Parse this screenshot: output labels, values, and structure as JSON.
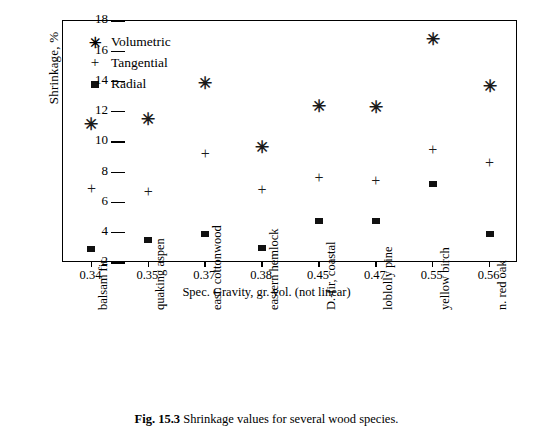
{
  "figure": {
    "caption_number": "Fig. 15.3",
    "caption_text": "Shrinkage values for several wood species."
  },
  "chart_data": {
    "type": "scatter",
    "title": "",
    "xlabel": "Spec. Gravity, gr. vol. (not linear)",
    "ylabel": "Shrinkage, %",
    "ylim": [
      2,
      18
    ],
    "yticks": [
      2,
      4,
      6,
      8,
      10,
      12,
      14,
      16,
      18
    ],
    "ytick_labels": [
      "2",
      "4",
      "6",
      "8",
      "10",
      "12",
      "14",
      "16",
      "18"
    ],
    "grid": false,
    "legend_position": "top-left",
    "x_axis_note": "not linear",
    "categories": [
      "0.34",
      "0.35",
      "0.37",
      "0.38",
      "0.45",
      "0.47",
      "0.55",
      "0.56"
    ],
    "category_names": [
      "balsam fir",
      "quaking aspen",
      "east. cottonwood",
      "eastern hemlock",
      "D.-fir, coastal",
      "loblolly pine",
      "yellow birch",
      "n. red oak"
    ],
    "series": [
      {
        "name": "Volumetric",
        "marker": "asterisk",
        "symbol": "✳",
        "values": [
          11.2,
          11.5,
          13.9,
          9.7,
          12.4,
          12.3,
          16.8,
          13.7
        ]
      },
      {
        "name": "Tangential",
        "marker": "plus",
        "symbol": "+",
        "values": [
          6.9,
          6.7,
          9.2,
          6.8,
          7.6,
          7.4,
          9.5,
          8.6
        ]
      },
      {
        "name": "Radial",
        "marker": "square",
        "symbol": "■",
        "values": [
          2.9,
          3.5,
          3.9,
          3.0,
          4.8,
          4.8,
          7.2,
          3.9
        ]
      }
    ]
  },
  "legend": {
    "items": [
      {
        "label": "Volumetric",
        "symbol": "✳"
      },
      {
        "label": "Tangential",
        "symbol": "+"
      },
      {
        "label": "Radial",
        "symbol": "■"
      }
    ]
  },
  "colors": {
    "axis": "#000000",
    "marker": "#111111",
    "background": "#ffffff"
  }
}
